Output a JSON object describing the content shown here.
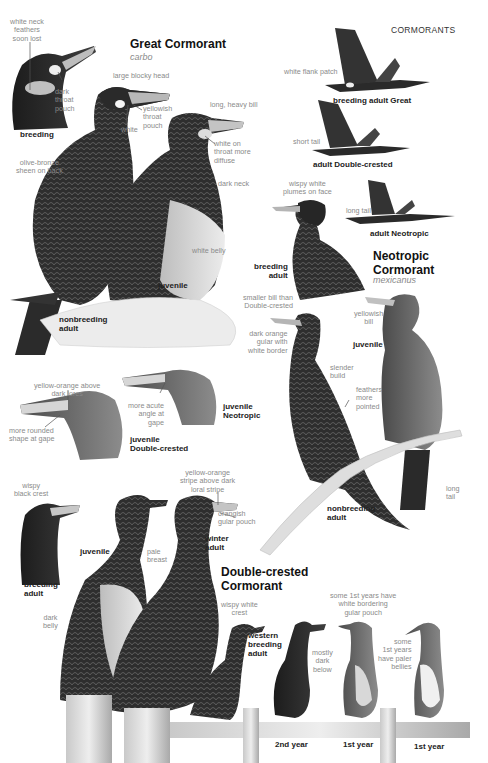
{
  "header": {
    "section": "CORMORANTS"
  },
  "great": {
    "title": "Great Cormorant",
    "scientific": "carbo",
    "notes": {
      "neck_feathers": "white neck\nfeathers\nsoon lost",
      "dark_pouch": "dark\nthroat\npouch",
      "blocky_head": "large blocky head",
      "yellow_pouch": "yellowish\nthroat\npouch",
      "white": "white",
      "heavy_bill": "long, heavy bill",
      "white_throat": "white on\nthroat more\ndiffuse",
      "olive_sheen": "olive-bronze\nsheen on back",
      "dark_neck": "dark neck",
      "white_belly": "white belly",
      "flank_patch": "white flank patch",
      "short_tail": "short tail"
    },
    "labels": {
      "breeding": "breeding",
      "nonbreeding": "nonbreeding\nadult",
      "juvenile": "juvenile",
      "flight_great": "breeding adult Great",
      "flight_dc": "adult Double-crested",
      "flight_neo": "adult Neotropic"
    }
  },
  "neotropic": {
    "title": "Neotropic\nCormorant",
    "scientific": "mexicanus",
    "notes": {
      "wispy_plumes": "wispy white\nplumes on face",
      "long_tail_flight": "long tail",
      "smaller_bill": "smaller bill than\nDouble-crested",
      "dark_orange": "dark orange\ngular with\nwhite border",
      "yellowish_bill": "yellowish\nbill",
      "slender": "slender\nbuild",
      "feathers_pointed": "feathers\nmore\npointed",
      "long_tail": "long\ntail"
    },
    "labels": {
      "breeding": "breeding\nadult",
      "juvenile": "juvenile",
      "nonbreeding": "nonbreeding\nadult"
    }
  },
  "juvenile_heads": {
    "notes": {
      "yellow_orange": "yellow-orange above\ndark lores",
      "rounded_gape": "more rounded\nshape at gape",
      "acute_angle": "more acute\nangle at\ngape"
    },
    "labels": {
      "dc": "juvenile\nDouble-crested",
      "neo": "juvenile\nNeotropic"
    }
  },
  "double_crested": {
    "title": "Double-crested\nCormorant",
    "notes": {
      "black_crest": "wispy\nblack crest",
      "stripe": "yellow-orange\nstripe above dark\nloral stripe",
      "gular": "orangish\ngular pouch",
      "pale_breast": "pale\nbreast",
      "dark_belly": "dark\nbelly",
      "white_crest": "wispy white\ncrest",
      "mostly_dark": "mostly\ndark\nbelow",
      "white_border": "some 1st years have\nwhite bordering\ngular pouch",
      "paler_bellies": "some\n1st years\nhave paler\nbellies"
    },
    "labels": {
      "breeding": "breeding\nadult",
      "juvenile": "juvenile",
      "winter": "winter\nadult",
      "western": "western\nbreeding\nadult",
      "second_year": "2nd year",
      "first_year_a": "1st year",
      "first_year_b": "1st year"
    }
  },
  "colors": {
    "ink": "#1e1e1e",
    "note": "#8a8a8a",
    "plumage_dark": "#2a2a2a",
    "plumage_mid": "#6d6d6d",
    "pale": "#d9d9d9"
  }
}
